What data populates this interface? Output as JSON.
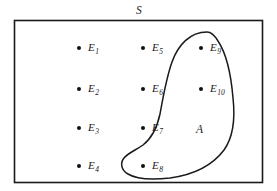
{
  "figure": {
    "type": "venn-diagram",
    "title_label": "S",
    "universe": {
      "name": "S",
      "label": "S",
      "shape": "rectangle",
      "x": 14,
      "y": 20,
      "width": 249,
      "height": 163,
      "stroke": "#1a1a1a",
      "fill": "#ffffff"
    },
    "event": {
      "name": "A",
      "label": "A",
      "shape": "closed-curve",
      "label_x": 198,
      "label_y": 131,
      "stroke": "#1a1a1a",
      "fill": "none",
      "contains": [
        "E_8",
        "E_9",
        "E_10"
      ]
    },
    "outcomes": [
      {
        "id": "E1",
        "base": "E",
        "sub": "1",
        "dot_x": 79,
        "dot_y": 48,
        "label_x": 88,
        "label_y": 42,
        "in_A": false
      },
      {
        "id": "E2",
        "base": "E",
        "sub": "2",
        "dot_x": 79,
        "dot_y": 89,
        "label_x": 88,
        "label_y": 83,
        "in_A": false
      },
      {
        "id": "E3",
        "base": "E",
        "sub": "3",
        "dot_x": 79,
        "dot_y": 128,
        "label_x": 88,
        "label_y": 122,
        "in_A": false
      },
      {
        "id": "E4",
        "base": "E",
        "sub": "4",
        "dot_x": 79,
        "dot_y": 166,
        "label_x": 88,
        "label_y": 160,
        "in_A": false
      },
      {
        "id": "E5",
        "base": "E",
        "sub": "5",
        "dot_x": 143,
        "dot_y": 48,
        "label_x": 152,
        "label_y": 42,
        "in_A": false
      },
      {
        "id": "E6",
        "base": "E",
        "sub": "6",
        "dot_x": 143,
        "dot_y": 89,
        "label_x": 152,
        "label_y": 83,
        "in_A": false
      },
      {
        "id": "E7",
        "base": "E",
        "sub": "7",
        "dot_x": 143,
        "dot_y": 128,
        "label_x": 152,
        "label_y": 122,
        "in_A": false
      },
      {
        "id": "E8",
        "base": "E",
        "sub": "8",
        "dot_x": 143,
        "dot_y": 166,
        "label_x": 152,
        "label_y": 160,
        "in_A": true
      },
      {
        "id": "E9",
        "base": "E",
        "sub": "9",
        "dot_x": 201,
        "dot_y": 48,
        "label_x": 210,
        "label_y": 42,
        "in_A": true
      },
      {
        "id": "E10",
        "base": "E",
        "sub": "10",
        "dot_x": 201,
        "dot_y": 89,
        "label_x": 210,
        "label_y": 83,
        "in_A": true
      }
    ]
  }
}
